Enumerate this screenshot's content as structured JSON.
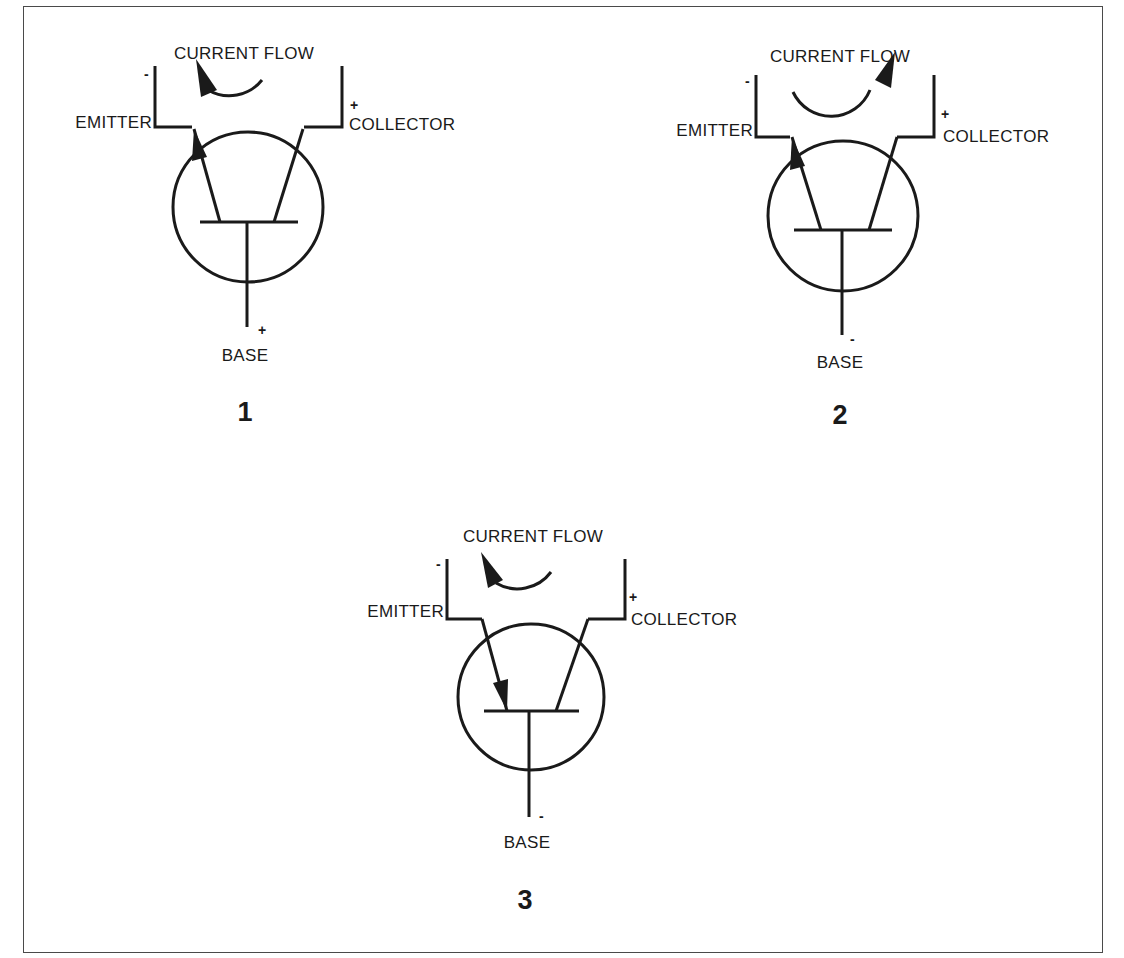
{
  "figure": {
    "transistors": [
      {
        "id": "1",
        "number_label": "1",
        "current_flow_label": "CURRENT FLOW",
        "current_flow_direction": "counterclockwise (arrow toward emitter)",
        "emitter_label": "EMITTER",
        "emitter_polarity": "-",
        "collector_label": "COLLECTOR",
        "collector_polarity": "+",
        "base_label": "BASE",
        "base_polarity": "+",
        "emitter_arrow": "outward (toward emitter lead)"
      },
      {
        "id": "2",
        "number_label": "2",
        "current_flow_label": "CURRENT FLOW",
        "current_flow_direction": "clockwise (arrow toward collector)",
        "emitter_label": "EMITTER",
        "emitter_polarity": "-",
        "collector_label": "COLLECTOR",
        "collector_polarity": "+",
        "base_label": "BASE",
        "base_polarity": "-",
        "emitter_arrow": "outward (toward emitter lead)"
      },
      {
        "id": "3",
        "number_label": "3",
        "current_flow_label": "CURRENT FLOW",
        "current_flow_direction": "counterclockwise (arrow toward emitter)",
        "emitter_label": "EMITTER",
        "emitter_polarity": "-",
        "collector_label": "COLLECTOR",
        "collector_polarity": "+",
        "base_label": "BASE",
        "base_polarity": "-",
        "emitter_arrow": "inward (toward base bar)"
      }
    ]
  }
}
